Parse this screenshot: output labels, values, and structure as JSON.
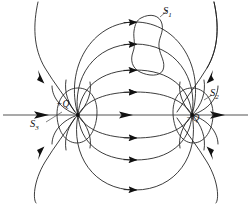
{
  "figure": {
    "kind": "electric-dipole-field-diagram",
    "background_color": "#ffffff",
    "line_color": "#1a1a1a",
    "axis_color": "#8c8c8c"
  },
  "charges": {
    "positive": {
      "label": "+Q",
      "name": "positive-point-charge",
      "x": 78,
      "y": 115
    },
    "negative": {
      "label": "−Q",
      "name": "negative-point-charge",
      "x": 192,
      "y": 115
    }
  },
  "surfaces": [
    {
      "id": "S1",
      "label": "S",
      "subscript": "1",
      "shape": "irregular-blob",
      "encloses": "no-charge",
      "location": "top-center, straddling field lines"
    },
    {
      "id": "S2",
      "label": "S",
      "subscript": "2",
      "shape": "closed-loop",
      "encloses": "negative-charge",
      "location": "around -Q at right"
    },
    {
      "id": "S3",
      "label": "S",
      "subscript": "3",
      "shape": "closed-loop",
      "encloses": "positive-charge",
      "location": "around +Q at left"
    }
  ],
  "axis": {
    "name": "dipole-axis",
    "y": 115,
    "from_x": 2,
    "to_x": 249,
    "has_left_arrow": true,
    "has_right_arrow": true
  },
  "field_lines": {
    "count": 14,
    "direction": "from positive charge to negative charge",
    "arrow_glyph": "▶"
  }
}
